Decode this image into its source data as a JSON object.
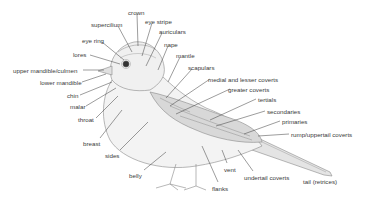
{
  "diagram": {
    "labels": [
      {
        "id": "crown",
        "text": "crown",
        "x": 128,
        "y": 9
      },
      {
        "id": "supercilium",
        "text": "supercilium",
        "x": 91,
        "y": 21
      },
      {
        "id": "eye-stripe",
        "text": "eye stripe",
        "x": 145,
        "y": 18
      },
      {
        "id": "auriculars",
        "text": "auriculars",
        "x": 159,
        "y": 28
      },
      {
        "id": "eye-ring",
        "text": "eye ring",
        "x": 82,
        "y": 37
      },
      {
        "id": "nape",
        "text": "nape",
        "x": 164,
        "y": 41
      },
      {
        "id": "lores",
        "text": "lores",
        "x": 73,
        "y": 51
      },
      {
        "id": "mantle",
        "text": "mantle",
        "x": 176,
        "y": 52
      },
      {
        "id": "upper-mandible-culmen",
        "text": "upper mandible/culmen",
        "x": 13,
        "y": 67
      },
      {
        "id": "scapulars",
        "text": "scapulars",
        "x": 188,
        "y": 64
      },
      {
        "id": "lower-mandible",
        "text": "lower mandible",
        "x": 40,
        "y": 79
      },
      {
        "id": "medial-lesser-coverts",
        "text": "medial and lesser coverts",
        "x": 208,
        "y": 76
      },
      {
        "id": "greater-coverts",
        "text": "greater coverts",
        "x": 228,
        "y": 86
      },
      {
        "id": "chin",
        "text": "chin",
        "x": 67,
        "y": 92
      },
      {
        "id": "tertials",
        "text": "tertials",
        "x": 258,
        "y": 96
      },
      {
        "id": "malar",
        "text": "malar",
        "x": 70,
        "y": 103
      },
      {
        "id": "secondaries",
        "text": "secondaries",
        "x": 267,
        "y": 108
      },
      {
        "id": "primaries",
        "text": "primaries",
        "x": 282,
        "y": 118
      },
      {
        "id": "throat",
        "text": "throat",
        "x": 78,
        "y": 116
      },
      {
        "id": "rump-uppertail-coverts",
        "text": "rump/uppertail coverts",
        "x": 291,
        "y": 131
      },
      {
        "id": "breast",
        "text": "breast",
        "x": 83,
        "y": 140
      },
      {
        "id": "sides",
        "text": "sides",
        "x": 105,
        "y": 152
      },
      {
        "id": "vent",
        "text": "vent",
        "x": 224,
        "y": 166
      },
      {
        "id": "belly",
        "text": "belly",
        "x": 129,
        "y": 172
      },
      {
        "id": "undertail-coverts",
        "text": "undertail coverts",
        "x": 244,
        "y": 174
      },
      {
        "id": "tail-retrices",
        "text": "tail (retrices)",
        "x": 303,
        "y": 178
      },
      {
        "id": "flanks",
        "text": "flanks",
        "x": 212,
        "y": 185
      }
    ]
  }
}
